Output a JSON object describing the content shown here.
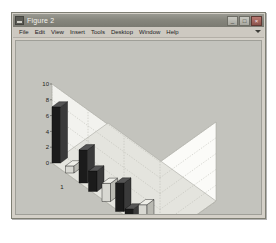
{
  "window": {
    "title": "Figure 2",
    "icon": "matlab-figure-icon",
    "controls": [
      {
        "name": "minimize",
        "glyph": "_"
      },
      {
        "name": "maximize",
        "glyph": "□"
      },
      {
        "name": "close",
        "glyph": "×"
      }
    ]
  },
  "menu": {
    "items": [
      {
        "label": "File"
      },
      {
        "label": "Edit"
      },
      {
        "label": "View"
      },
      {
        "label": "Insert"
      },
      {
        "label": "Tools"
      },
      {
        "label": "Desktop"
      },
      {
        "label": "Window"
      },
      {
        "label": "Help"
      }
    ],
    "overflow_icon": "chevron-down-icon"
  },
  "colors": {
    "window_face": "#d4d0c8",
    "titlebar": "#86867d",
    "figure_background": "#c3c3bd",
    "axes_wall": "#f2f2ee",
    "axes_floor": "#e4e4de",
    "bar_dark": "#1b1b1b",
    "bar_light": "#d8d8d2",
    "grid": "#b6b6ae",
    "text": "#1e1e1c"
  },
  "chart_data": {
    "type": "bar",
    "title": "",
    "xlabel": "",
    "ylabel": "",
    "zlabel": "",
    "projection": "3d-grouped-bars",
    "grid": true,
    "legend": null,
    "categories": [
      "1",
      "2",
      "3"
    ],
    "y_ticks": [
      0,
      2,
      4,
      6,
      8,
      10
    ],
    "ylim": [
      0,
      10
    ],
    "x_ticks": [
      "1",
      "2",
      "3"
    ],
    "series": [
      {
        "name": "bar-1",
        "color": "#1b1b1b",
        "values": [
          7.1,
          2.6,
          1.4
        ]
      },
      {
        "name": "bar-2",
        "color": "#d8d8d2",
        "values": [
          0.9,
          2.3,
          3.2
        ]
      },
      {
        "name": "bar-3",
        "color": "#1b1b1b",
        "values": [
          4.2,
          3.6,
          0.7
        ]
      }
    ]
  }
}
